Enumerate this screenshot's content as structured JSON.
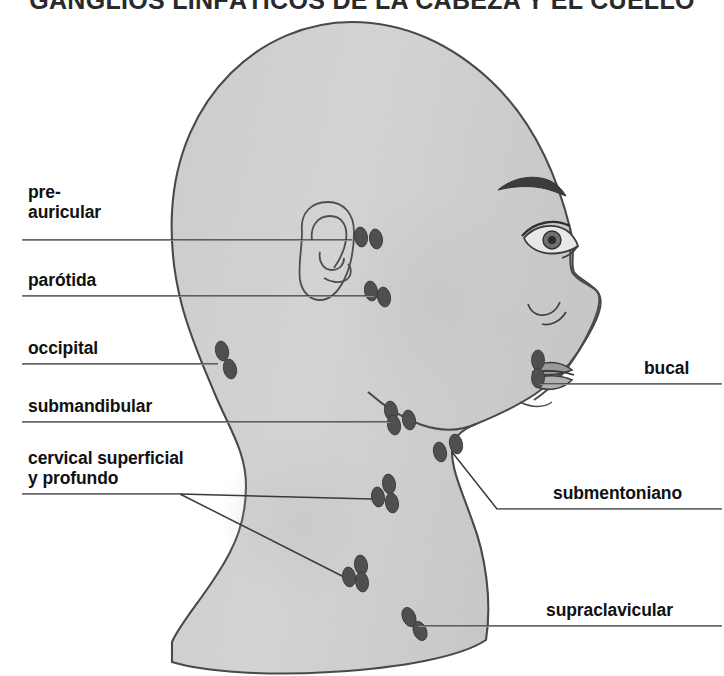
{
  "title": "GANGLIOS LINFÁTICOS DE LA CABEZA Y EL CUELLO",
  "figure": {
    "type": "anatomical-diagram",
    "style": "grayscale pencil illustration",
    "colors": {
      "skin_fill": "#d3d3d3",
      "outline": "#4a4a4a",
      "node_fill": "#4f4f4f",
      "leader_line": "#3a3a3a",
      "label_text": "#111111",
      "rule": "#8d8d8d",
      "background": "#ffffff"
    }
  },
  "labels_left": [
    {
      "id": "pre-auricular",
      "text": "pre-\nauricular",
      "x": 28,
      "y": 182,
      "rule_x": 22,
      "rule_w": 330,
      "rule_y": 240
    },
    {
      "id": "parotida",
      "text": "parótida",
      "x": 28,
      "y": 270,
      "rule_x": 22,
      "rule_w": 352,
      "rule_y": 296
    },
    {
      "id": "occipital",
      "text": "occipital",
      "x": 28,
      "y": 338,
      "rule_x": 22,
      "rule_w": 196,
      "rule_y": 364
    },
    {
      "id": "submandibular",
      "text": "submandibular",
      "x": 28,
      "y": 396,
      "rule_x": 22,
      "rule_w": 368,
      "rule_y": 422
    },
    {
      "id": "cervical",
      "text": "cervical superficial\ny profundo",
      "x": 28,
      "y": 448,
      "rule_x": 22,
      "rule_w": 158,
      "rule_y": 494
    }
  ],
  "labels_right": [
    {
      "id": "bucal",
      "text": "bucal",
      "x": 644,
      "y": 358,
      "rule_x": 540,
      "rule_w": 182,
      "rule_y": 384
    },
    {
      "id": "submentoniano",
      "text": "submentoniano",
      "x": 553,
      "y": 483,
      "rule_x": 497,
      "rule_w": 225,
      "rule_y": 509
    },
    {
      "id": "supraclavicular",
      "text": "supraclavicular",
      "x": 546,
      "y": 600,
      "rule_x": 418,
      "rule_w": 304,
      "rule_y": 626
    }
  ],
  "node_groups": [
    {
      "id": "pre-auricular",
      "count": 2,
      "nodes": [
        [
          361,
          237,
          9,
          14,
          -8
        ],
        [
          376,
          239,
          9,
          14,
          -8
        ]
      ]
    },
    {
      "id": "parotida",
      "count": 2,
      "nodes": [
        [
          371,
          291,
          9,
          14,
          -10
        ],
        [
          384,
          297,
          9,
          14,
          -10
        ]
      ]
    },
    {
      "id": "occipital",
      "count": 2,
      "nodes": [
        [
          222,
          351,
          9,
          14,
          -12
        ],
        [
          230,
          369,
          9,
          14,
          -12
        ]
      ]
    },
    {
      "id": "submandibular",
      "count": 3,
      "nodes": [
        [
          391,
          411,
          9,
          14,
          -10
        ],
        [
          409,
          420,
          9,
          14,
          -10
        ],
        [
          394,
          425,
          9,
          14,
          -10
        ]
      ]
    },
    {
      "id": "submentoniano",
      "count": 2,
      "nodes": [
        [
          456,
          444,
          9,
          14,
          -12
        ],
        [
          440,
          452,
          9,
          14,
          -12
        ]
      ]
    },
    {
      "id": "cervical-superior",
      "count": 3,
      "nodes": [
        [
          389,
          484,
          9,
          14,
          -8
        ],
        [
          378,
          497,
          9,
          14,
          -8
        ],
        [
          392,
          503,
          9,
          14,
          -8
        ]
      ]
    },
    {
      "id": "cervical-inferior",
      "count": 3,
      "nodes": [
        [
          361,
          565,
          9,
          14,
          -8
        ],
        [
          349,
          577,
          9,
          14,
          -8
        ],
        [
          362,
          582,
          9,
          14,
          -8
        ]
      ]
    },
    {
      "id": "supraclavicular",
      "count": 2,
      "nodes": [
        [
          409,
          617,
          9,
          14,
          -22
        ],
        [
          420,
          631,
          9,
          14,
          -22
        ]
      ]
    },
    {
      "id": "bucal",
      "count": 2,
      "nodes": [
        [
          538,
          360,
          9,
          14,
          0
        ],
        [
          538,
          378,
          9,
          14,
          0
        ]
      ]
    }
  ],
  "leader_lines": [
    {
      "id": "leader-pre-auricular",
      "points": "22,240 352,240 352,238"
    },
    {
      "id": "leader-parotida",
      "points": "22,296 374,296 374,297"
    },
    {
      "id": "leader-occipital",
      "points": "22,364 218,364"
    },
    {
      "id": "leader-submandibular",
      "points": "22,422 390,422"
    },
    {
      "id": "leader-cervical-a",
      "points": "22,494 180,494 372,498"
    },
    {
      "id": "leader-cervical-b",
      "points": "180,494 344,577"
    },
    {
      "id": "leader-bucal",
      "points": "722,384 540,384 538,378"
    },
    {
      "id": "leader-submentoniano",
      "points": "722,509 497,509 452,452"
    },
    {
      "id": "leader-supraclavicular",
      "points": "722,626 418,626"
    }
  ]
}
